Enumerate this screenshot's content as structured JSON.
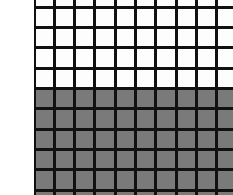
{
  "canvas": {
    "width": 233,
    "height": 195,
    "background_color": "#ffffff"
  },
  "left_margin": {
    "width": 34,
    "color": "#ffffff"
  },
  "grid": {
    "origin_x": 34,
    "origin_y": -13,
    "cell_pitch_x": 20.3,
    "cell_pitch_y": 20.3,
    "line_thickness": 3,
    "line_color": "#111111",
    "columns": 11,
    "rows": 11,
    "plane_width": 226,
    "plane_height": 226
  },
  "fill": {
    "white_color": "#fdfdfd",
    "gray_color": "#7a7a7a",
    "boundary_y": 101,
    "upper_region_label": "white cells",
    "lower_region_label": "gray cells"
  },
  "chart_data": {
    "type": "heatmap",
    "title": "",
    "xlabel": "",
    "ylabel": "",
    "grid": true,
    "legend": "none",
    "columns": 11,
    "rows": 11,
    "colors": {
      "0": "#fdfdfd",
      "1": "#7a7a7a"
    },
    "row_labels": [
      "r0",
      "r1",
      "r2",
      "r3",
      "r4",
      "r5",
      "r6",
      "r7",
      "r8",
      "r9",
      "r10"
    ],
    "column_labels": [
      "c0",
      "c1",
      "c2",
      "c3",
      "c4",
      "c5",
      "c6",
      "c7",
      "c8",
      "c9",
      "c10"
    ],
    "values": [
      [
        0,
        0,
        0,
        0,
        0,
        0,
        0,
        0,
        0,
        0,
        0
      ],
      [
        0,
        0,
        0,
        0,
        0,
        0,
        0,
        0,
        0,
        0,
        0
      ],
      [
        0,
        0,
        0,
        0,
        0,
        0,
        0,
        0,
        0,
        0,
        0
      ],
      [
        0,
        0,
        0,
        0,
        0,
        0,
        0,
        0,
        0,
        0,
        0
      ],
      [
        0,
        0,
        0,
        0,
        0,
        0,
        0,
        0,
        0,
        0,
        0
      ],
      [
        1,
        1,
        1,
        1,
        1,
        1,
        1,
        1,
        1,
        1,
        1
      ],
      [
        1,
        1,
        1,
        1,
        1,
        1,
        1,
        1,
        1,
        1,
        1
      ],
      [
        1,
        1,
        1,
        1,
        1,
        1,
        1,
        1,
        1,
        1,
        1
      ],
      [
        1,
        1,
        1,
        1,
        1,
        1,
        1,
        1,
        1,
        1,
        1
      ],
      [
        1,
        1,
        1,
        1,
        1,
        1,
        1,
        1,
        1,
        1,
        1
      ],
      [
        1,
        1,
        1,
        1,
        1,
        1,
        1,
        1,
        1,
        1,
        1
      ]
    ]
  }
}
